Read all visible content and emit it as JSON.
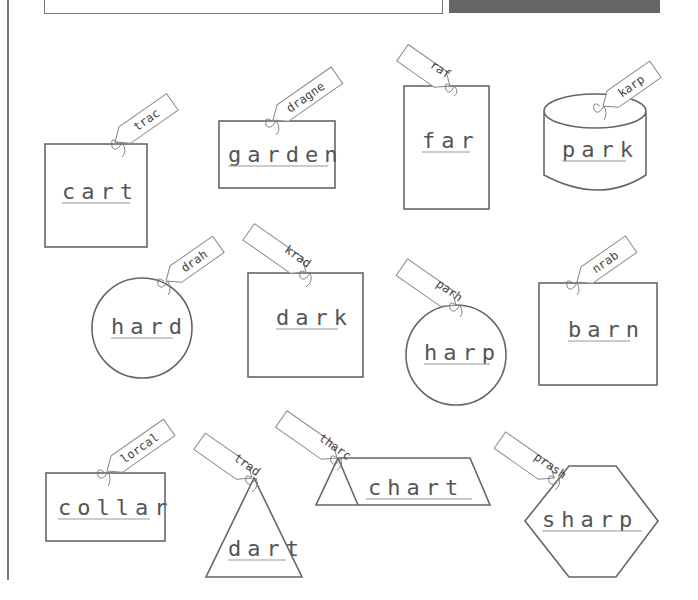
{
  "worksheet": {
    "items": [
      {
        "word": "cart",
        "tag": "trac",
        "shape": "square"
      },
      {
        "word": "garden",
        "tag": "dragne",
        "shape": "rectangle"
      },
      {
        "word": "far",
        "tag": "raf",
        "shape": "tall-rectangle"
      },
      {
        "word": "park",
        "tag": "karp",
        "shape": "cylinder"
      },
      {
        "word": "hard",
        "tag": "drah",
        "shape": "circle"
      },
      {
        "word": "dark",
        "tag": "krad",
        "shape": "square"
      },
      {
        "word": "harp",
        "tag": "parh",
        "shape": "circle"
      },
      {
        "word": "barn",
        "tag": "nrab",
        "shape": "square"
      },
      {
        "word": "collar",
        "tag": "lorcal",
        "shape": "rectangle"
      },
      {
        "word": "dart",
        "tag": "trad",
        "shape": "triangle"
      },
      {
        "word": "chart",
        "tag": "tharc",
        "shape": "trapezoid"
      },
      {
        "word": "sharp",
        "tag": "prash",
        "shape": "hexagon"
      }
    ]
  }
}
